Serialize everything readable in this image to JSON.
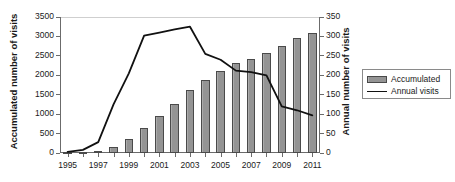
{
  "chart_data": {
    "type": "bar",
    "title": "",
    "xlabel": "",
    "ylabel": "Accumulated number of visits",
    "ylabel_secondary": "Annual number of visits",
    "grid": false,
    "legend_position": "right",
    "categories": [
      "1995",
      "1996",
      "1997",
      "1998",
      "1999",
      "2000",
      "2001",
      "2002",
      "2003",
      "2004",
      "2005",
      "2006",
      "2007",
      "2008",
      "2009",
      "2010",
      "2011"
    ],
    "xtick_labels": [
      "1995",
      "1997",
      "1999",
      "2001",
      "2003",
      "2005",
      "2007",
      "2009",
      "2011"
    ],
    "ylim": [
      0,
      3500
    ],
    "ytick_labels": [
      "0",
      "500",
      "1000",
      "1500",
      "2000",
      "2500",
      "3000",
      "3500"
    ],
    "ylim_secondary": [
      0,
      350
    ],
    "ytick_labels_secondary": [
      "0",
      "50",
      "100",
      "150",
      "200",
      "250",
      "300",
      "350"
    ],
    "series": [
      {
        "name": "Accumulated",
        "type": "bar",
        "axis": "left",
        "color": "#949494",
        "edge_color": "#4a4a4a",
        "values": [
          5,
          10,
          40,
          160,
          350,
          650,
          950,
          1260,
          1610,
          1870,
          2100,
          2310,
          2420,
          2570,
          2760,
          2950,
          3100
        ]
      },
      {
        "name": "Annual visits",
        "type": "line",
        "axis": "right",
        "color": "#111111",
        "values": [
          3,
          8,
          28,
          125,
          205,
          302,
          310,
          318,
          325,
          255,
          240,
          212,
          208,
          200,
          120,
          110,
          97
        ]
      }
    ]
  },
  "legend": {
    "items": [
      {
        "label": "Accumulated",
        "marker": "bar-swatch"
      },
      {
        "label": "Annual visits",
        "marker": "line-swatch"
      }
    ]
  }
}
